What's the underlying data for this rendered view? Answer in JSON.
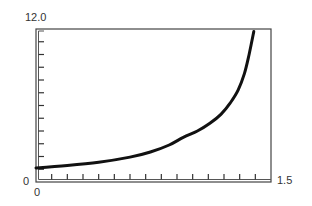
{
  "chart_data": {
    "type": "line",
    "title": "",
    "xlabel": "",
    "ylabel": "",
    "xlim": [
      0,
      1.5
    ],
    "ylim": [
      0,
      12.0
    ],
    "x_tick_step": 0.1,
    "y_tick_step": 1.0,
    "grid": false,
    "legend": null,
    "axis_labels": {
      "x_min": "0",
      "x_max": "1.5",
      "y_min": "0",
      "y_max": "12.0"
    },
    "series": [
      {
        "name": "curve",
        "color": "#111111",
        "x": [
          0,
          0.2,
          0.4,
          0.6,
          0.73,
          0.85,
          0.94,
          1.03,
          1.11,
          1.18,
          1.24,
          1.29,
          1.33,
          1.36,
          1.39
        ],
        "y": [
          1.1,
          1.3,
          1.55,
          1.95,
          2.35,
          2.9,
          3.5,
          4.0,
          4.6,
          5.3,
          6.2,
          7.2,
          8.5,
          10.0,
          11.8
        ]
      }
    ]
  }
}
